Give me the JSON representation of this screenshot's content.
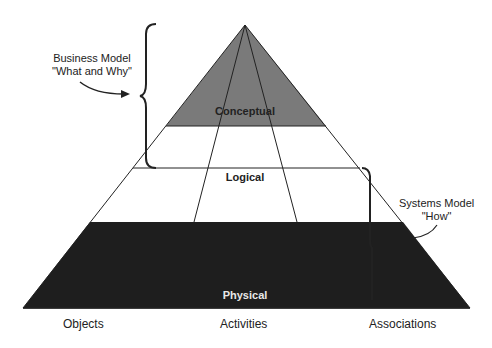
{
  "diagram": {
    "levels": [
      {
        "label": "Conceptual",
        "fill": "#7a7a7a",
        "text_color": "#222222"
      },
      {
        "label": "Logical",
        "fill": "#ffffff",
        "text_color": "#222222"
      },
      {
        "label": "Physical",
        "fill": "#1e1e1e",
        "text_color": "#e8e8e8"
      }
    ],
    "columns": [
      "Objects",
      "Activities",
      "Associations"
    ],
    "annotations": {
      "business_model": {
        "line1": "Business Model",
        "line2": "\"What and Why\""
      },
      "systems_model": {
        "line1": "Systems Model",
        "line2": "\"How\""
      }
    }
  }
}
